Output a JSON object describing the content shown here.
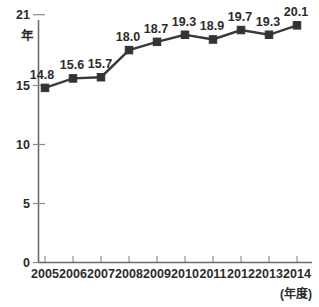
{
  "chart_data": {
    "type": "line",
    "title": "",
    "subtitle": "",
    "xlabel": "(年度)",
    "ylabel": "年",
    "categories": [
      "2005",
      "2006",
      "2007",
      "2008",
      "2009",
      "2010",
      "2011",
      "2012",
      "2013",
      "2014"
    ],
    "values": [
      14.8,
      15.6,
      15.7,
      18.0,
      18.7,
      19.3,
      18.9,
      19.7,
      19.3,
      20.1
    ],
    "point_labels": [
      "14.8",
      "15.6",
      "15.7",
      "18.0",
      "18.7",
      "19.3",
      "18.9",
      "19.7",
      "19.3",
      "20.1"
    ],
    "ylim": [
      0,
      21
    ],
    "ytick_labels": [
      "21",
      "15",
      "10",
      "5",
      "0"
    ],
    "ytick_values": [
      21,
      15,
      10,
      5,
      0
    ],
    "xtick_labels": [
      "2005",
      "2006",
      "2007",
      "2008",
      "2009",
      "2010",
      "2011",
      "2012",
      "2013",
      "2014"
    ],
    "grid": false,
    "legend": "none",
    "series_name": "",
    "marker": "square",
    "line_color": "#333333",
    "marker_color": "#333333",
    "axis_color": "#6b6b6b",
    "background_color": "#ffffff"
  },
  "axis": {
    "y_unit": "年",
    "y_top_label": "21",
    "x_caption": "(年度)"
  }
}
